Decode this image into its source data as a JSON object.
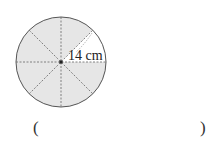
{
  "figure": {
    "shape": "circle",
    "sectors": 8,
    "unshaded_sectors": 1,
    "radius_label": "14 cm",
    "shade_color": "#e6e6e6",
    "line_color": "#555555"
  },
  "answer": {
    "open_paren": "(",
    "close_paren": ")",
    "value": ""
  }
}
